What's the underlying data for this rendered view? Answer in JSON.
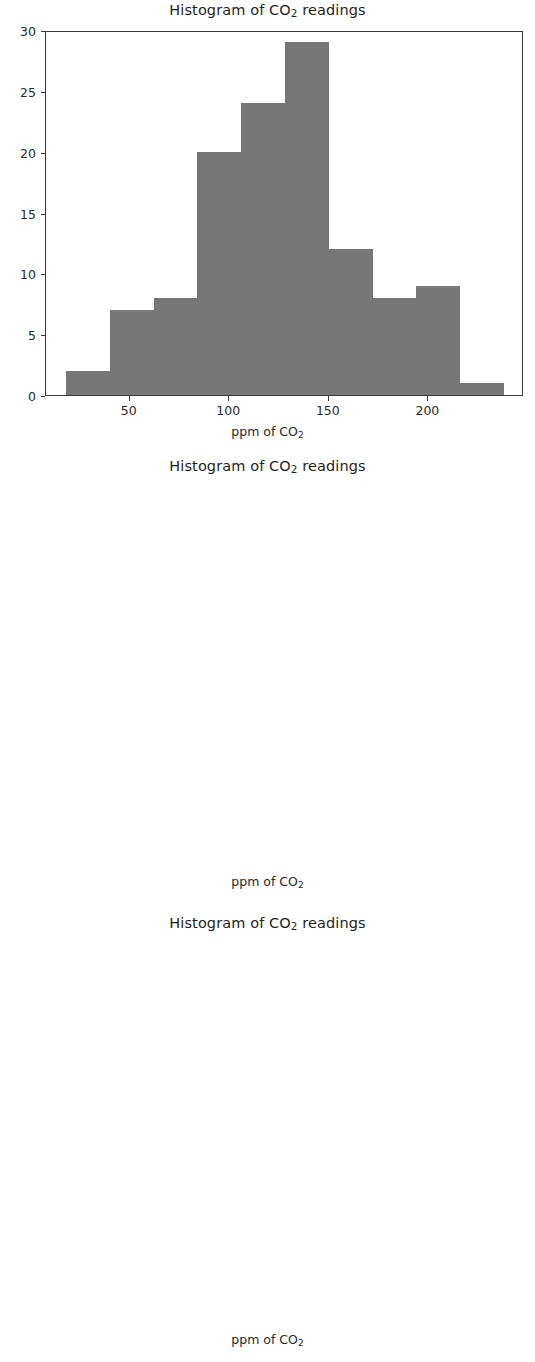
{
  "figure": {
    "background_color": "#ffffff",
    "bar_color": "#777777",
    "axis_color": "#3b3b3b",
    "text_color": "#2a2a2a"
  },
  "charts": [
    {
      "id": "histogram-1",
      "title_prefix": "Histogram of CO",
      "title_sub": "2",
      "title_suffix": " readings",
      "xlabel_prefix": "ppm of CO",
      "xlabel_sub": "2",
      "ytick_labels": [
        "30",
        "25",
        "20",
        "15",
        "10",
        "5",
        "0"
      ],
      "xtick_labels": [
        "50",
        "100",
        "150",
        "200"
      ]
    },
    {
      "id": "histogram-2",
      "title_prefix": "Histogram of CO",
      "title_sub": "2",
      "title_suffix": " readings",
      "xlabel_prefix": "ppm of CO",
      "xlabel_sub": "2",
      "ytick_labels": [
        "20.0",
        "17.5",
        "15.0",
        "12.5",
        "10.0",
        "7.5",
        "5.0",
        "2.5",
        "0.0"
      ],
      "xtick_labels": [
        "80",
        "100",
        "120",
        "140",
        "160",
        "180",
        "200"
      ]
    },
    {
      "id": "histogram-3",
      "title_prefix": "Histogram of CO",
      "title_sub": "2",
      "title_suffix": " readings",
      "xlabel_prefix": "ppm of CO",
      "xlabel_sub": "2",
      "ytick_labels": [
        "25",
        "20",
        "15",
        "10",
        "5",
        "0"
      ],
      "xtick_labels": [
        "50",
        "100",
        "150",
        "200",
        "250",
        "300"
      ]
    }
  ],
  "chart_data": [
    {
      "type": "bar",
      "subtype": "histogram",
      "title": "Histogram of CO2 readings",
      "xlabel": "ppm of CO2",
      "ylabel": "",
      "bin_edges": [
        18,
        40,
        62,
        84,
        106,
        128,
        150,
        172,
        194,
        216,
        238
      ],
      "values": [
        2,
        7,
        8,
        20,
        24,
        29,
        12,
        8,
        9,
        1
      ],
      "xlim": [
        8,
        248
      ],
      "ylim": [
        0,
        30
      ],
      "xticks": [
        50,
        100,
        150,
        200
      ],
      "yticks": [
        0,
        5,
        10,
        15,
        20,
        25,
        30
      ],
      "grid": false,
      "legend": null,
      "bar_color": "#777777"
    },
    {
      "type": "bar",
      "subtype": "histogram",
      "title": "Histogram of CO2 readings",
      "xlabel": "ppm of CO2",
      "ylabel": "",
      "bin_edges": [
        69,
        82.4,
        95.8,
        109.2,
        122.6,
        136,
        149.4,
        162.8,
        176.2,
        189.6,
        203
      ],
      "values": [
        3,
        6,
        10,
        20,
        18,
        19,
        15,
        13,
        6,
        10
      ],
      "xlim": [
        62,
        210
      ],
      "ylim": [
        0,
        20
      ],
      "xticks": [
        80,
        100,
        120,
        140,
        160,
        180,
        200
      ],
      "yticks": [
        0.0,
        2.5,
        5.0,
        7.5,
        10.0,
        12.5,
        15.0,
        17.5,
        20.0
      ],
      "grid": false,
      "legend": null,
      "bar_color": "#777777"
    },
    {
      "type": "bar",
      "subtype": "histogram",
      "title": "Histogram of CO2 readings",
      "xlabel": "ppm of CO2",
      "ylabel": "",
      "bin_edges": [
        42,
        66.6,
        91.2,
        115.8,
        140.4,
        165,
        189.6,
        214.2,
        238.8,
        263.4,
        288
      ],
      "values": [
        6,
        11,
        15,
        25,
        16,
        25,
        6,
        8,
        5,
        3
      ],
      "xlim": [
        30,
        300
      ],
      "ylim": [
        0,
        26
      ],
      "xticks": [
        50,
        100,
        150,
        200,
        250,
        300
      ],
      "yticks": [
        0,
        5,
        10,
        15,
        20,
        25
      ],
      "grid": false,
      "legend": null,
      "bar_color": "#777777"
    }
  ],
  "layout": {
    "axes_boxes": [
      {
        "left": 45,
        "top": 31,
        "width": 478,
        "height": 365
      },
      {
        "left": 45,
        "top": 487,
        "width": 478,
        "height": 364
      },
      {
        "left": 45,
        "top": 943,
        "width": 478,
        "height": 362
      }
    ],
    "title_tops": [
      2,
      8,
      10
    ],
    "xlabel_tops": [
      424,
      880,
      1337
    ]
  }
}
